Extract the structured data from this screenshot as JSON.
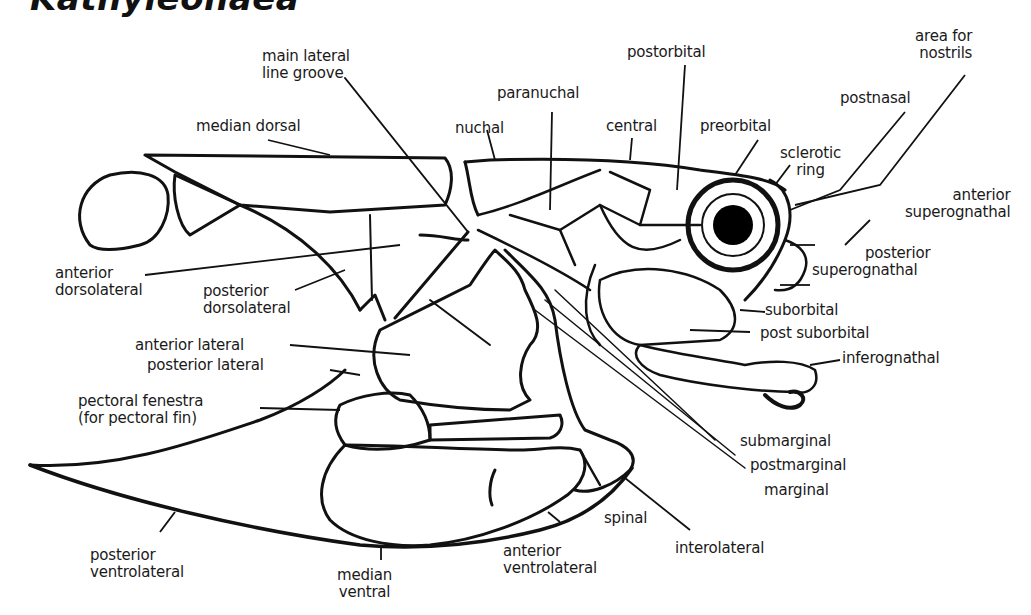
{
  "title": "Kathyleonaea",
  "diagram": {
    "type": "anatomical-labeled-illustration",
    "colors": {
      "ink": "#111111",
      "background": "#ffffff",
      "eye": "#000000"
    },
    "labels": {
      "main_lateral_line_groove": [
        "main lateral",
        "line groove"
      ],
      "median_dorsal": "median dorsal",
      "nuchal": "nuchal",
      "paranuchal": "paranuchal",
      "postorbital": "postorbital",
      "central": "central",
      "preorbital": "preorbital",
      "sclerotic_ring": [
        "sclerotic",
        "ring"
      ],
      "postnasal": "postnasal",
      "area_for_nostrils": [
        "area for",
        "nostrils"
      ],
      "anterior_superognathal": [
        "anterior",
        "superognathal"
      ],
      "posterior_superognathal": [
        "posterior",
        "superognathal"
      ],
      "suborbital": "suborbital",
      "post_suborbital": "post suborbital",
      "inferognathal": "inferognathal",
      "anterior_dorsolateral": [
        "anterior",
        "dorsolateral"
      ],
      "posterior_dorsolateral": [
        "posterior",
        "dorsolateral"
      ],
      "anterior_lateral": "anterior lateral",
      "posterior_lateral": "posterior lateral",
      "pectoral_fenestra": [
        "pectoral fenestra",
        "(for pectoral fin)"
      ],
      "submarginal": "submarginal",
      "postmarginal": "postmarginal",
      "marginal": "marginal",
      "spinal": "spinal",
      "interolateral": "interolateral",
      "anterior_ventrolateral": [
        "anterior",
        "ventrolateral"
      ],
      "posterior_ventrolateral": [
        "posterior",
        "ventrolateral"
      ],
      "median_ventral": [
        "median",
        "ventral"
      ]
    }
  }
}
